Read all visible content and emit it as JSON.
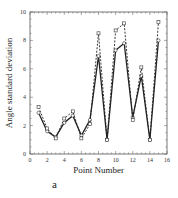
{
  "chart_data": {
    "type": "line",
    "title": "",
    "xlabel": "Point Number",
    "ylabel": "Angle standard deviation",
    "xlim": [
      0,
      16
    ],
    "ylim": [
      0,
      10
    ],
    "xticks": [
      0,
      2,
      4,
      6,
      8,
      10,
      12,
      14,
      16
    ],
    "yticks": [
      0,
      2,
      4,
      6,
      8,
      10
    ],
    "grid": false,
    "legend": null,
    "x": [
      1,
      2,
      3,
      4,
      5,
      6,
      7,
      8,
      9,
      10,
      11,
      12,
      13,
      14,
      15
    ],
    "series": [
      {
        "name": "solid",
        "style": "solid",
        "marker": "circle",
        "values": [
          2.9,
          1.6,
          1.2,
          2.2,
          2.7,
          1.3,
          2.4,
          6.9,
          1.0,
          7.3,
          7.8,
          2.6,
          5.5,
          1.0,
          8.0
        ]
      },
      {
        "name": "dashed",
        "style": "dashed",
        "marker": "square",
        "values": [
          3.3,
          1.8,
          1.1,
          2.5,
          3.0,
          1.1,
          2.1,
          8.5,
          1.0,
          8.7,
          9.2,
          2.4,
          6.1,
          1.0,
          9.3
        ]
      }
    ],
    "caption": "a"
  }
}
